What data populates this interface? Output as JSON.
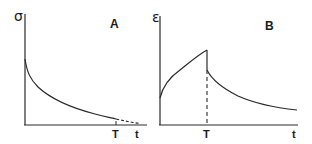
{
  "panels": [
    {
      "id": "A",
      "label": "A",
      "y_axis_label": "σ",
      "x_axis_label": "t",
      "marker_label": "T",
      "description": "Stress relaxation: σ decays over time from an initial peak, approaching zero; curve becomes dashed past T"
    },
    {
      "id": "B",
      "label": "B",
      "y_axis_label": "ε",
      "x_axis_label": "t",
      "marker_label": "T",
      "description": "Creep and recovery: ε rises (concave) until T, drops instantaneously (dashed vertical), then decays gradually"
    }
  ],
  "colors": {
    "line": "#2a2a2a",
    "background": "#ffffff"
  }
}
